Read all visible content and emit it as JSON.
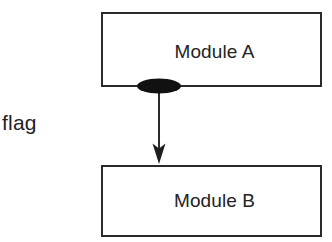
{
  "diagram": {
    "background_color": "#ffffff",
    "line_color": "#2b2b2b",
    "text_color": "#232323",
    "coupling_marker_color": "#111111",
    "nodes": [
      {
        "id": "module-a",
        "label": "Module A"
      },
      {
        "id": "module-b",
        "label": "Module B"
      }
    ],
    "annotations": [
      {
        "id": "flag",
        "label": "flag"
      }
    ],
    "connector": {
      "from": "module-a",
      "to": "module-b",
      "marker": "filled-ellipse",
      "arrowhead": "solid-dart",
      "direction": "downward"
    }
  }
}
